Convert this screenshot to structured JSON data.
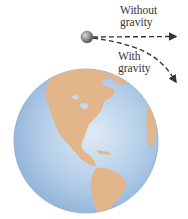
{
  "diagram": {
    "labels": {
      "without_gravity_line1": "Without",
      "without_gravity_line2": "gravity",
      "with_gravity_line1": "With",
      "with_gravity_line2": "gravity"
    },
    "colors": {
      "background": "#ffffff",
      "ocean": "#a9c6e4",
      "land": "#e2b68a",
      "path": "#333333",
      "ball": "#7a7a7a"
    },
    "elements": [
      "ball",
      "straight-path-without-gravity",
      "curved-path-with-gravity",
      "earth-globe"
    ]
  }
}
